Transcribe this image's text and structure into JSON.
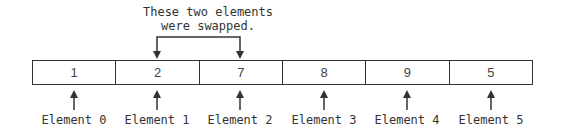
{
  "caption": {
    "line1": "These two elements",
    "line2": "were swapped."
  },
  "array": {
    "cells": [
      {
        "value": "1",
        "label": "Element 0"
      },
      {
        "value": "2",
        "label": "Element 1"
      },
      {
        "value": "7",
        "label": "Element 2"
      },
      {
        "value": "8",
        "label": "Element 3"
      },
      {
        "value": "9",
        "label": "Element 4"
      },
      {
        "value": "5",
        "label": "Element 5"
      }
    ],
    "swapped_indices": [
      1,
      2
    ]
  },
  "colors": {
    "stroke": "#333333",
    "text": "#333333",
    "background": "#ffffff"
  }
}
